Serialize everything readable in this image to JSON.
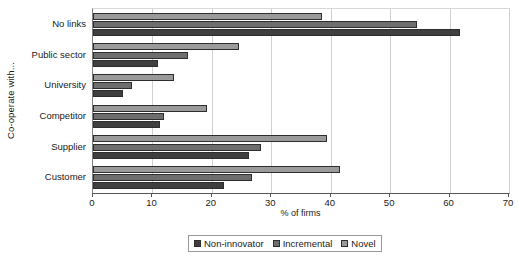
{
  "chart_data": {
    "type": "bar",
    "orientation": "horizontal",
    "title": "",
    "xlabel": "% of firms",
    "ylabel": "Co-operate with...",
    "xlim": [
      0,
      70
    ],
    "xticks": [
      0,
      10,
      20,
      30,
      40,
      50,
      60,
      70
    ],
    "grid": true,
    "legend_position": "bottom",
    "categories": [
      "No links",
      "Public sector",
      "University",
      "Competitor",
      "Supplier",
      "Customer"
    ],
    "series": [
      {
        "name": "Non-innovator",
        "color": "#3f3f3f",
        "values": [
          61.8,
          11.0,
          5.0,
          11.3,
          26.2,
          22.0
        ]
      },
      {
        "name": "Incremental",
        "color": "#6e6e6e",
        "values": [
          54.5,
          16.0,
          6.6,
          12.0,
          28.2,
          26.8
        ]
      },
      {
        "name": "Novel",
        "color": "#9a9a9a",
        "values": [
          38.5,
          24.5,
          13.7,
          19.2,
          39.3,
          41.5
        ]
      }
    ],
    "series_draw_order_top_to_bottom": [
      "Novel",
      "Incremental",
      "Non-innovator"
    ]
  },
  "axes": {
    "y_title": "Co-operate with...",
    "x_title": "% of firms",
    "x_tick_labels": [
      "0",
      "10",
      "20",
      "30",
      "40",
      "50",
      "60",
      "70"
    ],
    "category_labels": [
      "No links",
      "Public sector",
      "University",
      "Competitor",
      "Supplier",
      "Customer"
    ]
  },
  "legend": {
    "items": [
      {
        "label": "Non-innovator",
        "color": "#3f3f3f"
      },
      {
        "label": "Incremental",
        "color": "#6e6e6e"
      },
      {
        "label": "Novel",
        "color": "#9a9a9a"
      }
    ]
  }
}
